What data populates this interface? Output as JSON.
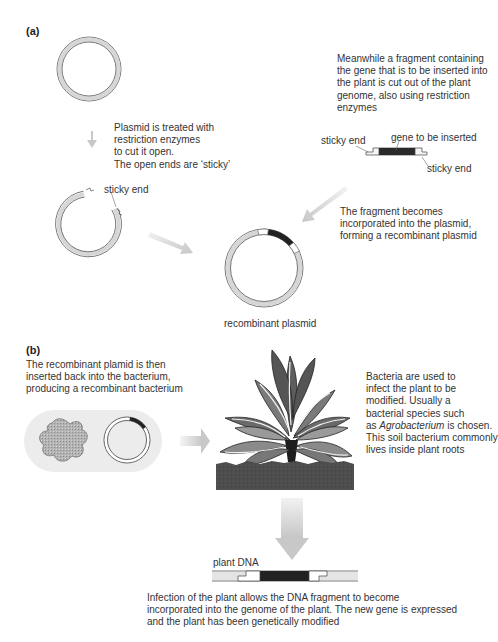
{
  "section_a": {
    "label": "(a)",
    "step1_text": [
      "Plasmid is treated with",
      "restriction enzymes",
      "to cut it open.",
      "The open ends are ‘sticky’"
    ],
    "step2_text": [
      "Meanwhile a fragment containing",
      "the gene that is to be inserted into",
      "the plant is cut out of the plant",
      "genome, also using restriction",
      "enzymes"
    ],
    "fragment_labels": {
      "sticky_end_left": "sticky end",
      "gene": "gene to be inserted",
      "sticky_end_right": "sticky end"
    },
    "cut_plasmid_label": "sticky end",
    "step3_text": [
      "The fragment becomes",
      "incorporated into the plasmid,",
      "forming a recombinant plasmid"
    ],
    "recombinant_label": "recombinant plasmid"
  },
  "section_b": {
    "label": "(b)",
    "step4_text": [
      "The recombinant plamid is then",
      "inserted back into the bacterium,",
      "producing a recombinant bacterium"
    ],
    "step5_text": [
      "Bacteria are used to",
      "infect the plant to be",
      "modified. Usually a",
      "bacterial species such"
    ],
    "step5_text_as": "as ",
    "step5_text_italic": "Agrobacterium",
    "step5_text_after": " is chosen.",
    "step5_text_tail": [
      "This soil bacterium commonly",
      "lives inside plant roots"
    ],
    "plant_dna_label": "plant DNA",
    "final_text": [
      "Infection of the plant allows the DNA fragment to become",
      "incorporated into the genome of the plant. The new gene is expressed",
      "and the plant has been genetically modified"
    ]
  },
  "colors": {
    "plasmid_ring": "#d4d4d4",
    "outline": "#555555",
    "gene": "#222222",
    "arrow": "#cfcfcf",
    "soil": "#4a4a4a",
    "bacterium_bg": "#ececec",
    "bacterium": "#a8a8a8"
  }
}
